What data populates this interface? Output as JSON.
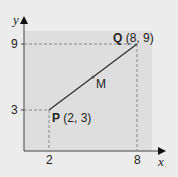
{
  "figure": {
    "axes": {
      "x_label": "x",
      "y_label": "y"
    },
    "ticks": {
      "x": [
        "2",
        "8"
      ],
      "y": [
        "3",
        "9"
      ]
    },
    "points": {
      "P": {
        "name": "P",
        "coords": "(2, 3)"
      },
      "Q": {
        "name": "Q",
        "coords": "(8, 9)"
      },
      "M": {
        "name": "M"
      }
    },
    "colors": {
      "background": "#ececec",
      "panel": "#dcdcdc",
      "line": "#333333",
      "dashed": "#888888"
    }
  }
}
